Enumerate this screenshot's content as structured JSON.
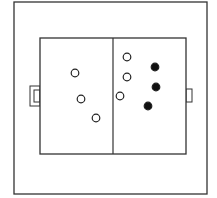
{
  "diagram": {
    "type": "soccer-field-formation",
    "colors": {
      "line": "#333333",
      "background": "#ffffff",
      "team_a": "#ffffff",
      "team_b": "#111111"
    },
    "frame": {
      "x": 14,
      "y": 2,
      "w": 193,
      "h": 192
    },
    "field": {
      "x": 40,
      "y": 38,
      "w": 146,
      "h": 116,
      "midline_x": 113
    },
    "goals": [
      {
        "side": "left",
        "x": 30,
        "y": 86,
        "w": 10,
        "h": 20
      },
      {
        "side": "right",
        "x": 186,
        "y": 89,
        "w": 6,
        "h": 13
      }
    ],
    "players_open": [
      {
        "x": 75,
        "y": 73
      },
      {
        "x": 81,
        "y": 99
      },
      {
        "x": 96,
        "y": 118
      },
      {
        "x": 127,
        "y": 57
      },
      {
        "x": 127,
        "y": 77
      },
      {
        "x": 120,
        "y": 96
      }
    ],
    "players_filled": [
      {
        "x": 155,
        "y": 67
      },
      {
        "x": 156,
        "y": 87
      },
      {
        "x": 148,
        "y": 106
      }
    ]
  }
}
